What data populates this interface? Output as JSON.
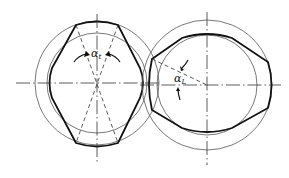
{
  "figure": {
    "type": "technical line drawing",
    "colors": {
      "background": "#ffffff",
      "ink": "#111111",
      "thin_line": "#555555"
    }
  },
  "labels": {
    "left_angle": {
      "symbol": "α",
      "subscript": "t"
    },
    "right_angle": {
      "symbol": "α",
      "subscript": "L"
    }
  },
  "rotors": [
    {
      "name": "left-rotor",
      "cx": 97,
      "cy": 83,
      "outer_r": 62,
      "inner_r": 50
    },
    {
      "name": "right-rotor",
      "cx": 207,
      "cy": 85,
      "outer_r": 65,
      "inner_r": 50
    }
  ]
}
